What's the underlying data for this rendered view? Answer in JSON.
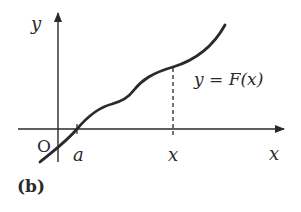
{
  "figure": {
    "panel_label": "(b)",
    "axes": {
      "y_label": "y",
      "x_label": "x",
      "origin_label": "O"
    },
    "ticks": {
      "a_label": "a",
      "x_label": "x"
    },
    "curve_label": "y = F(x)",
    "colors": {
      "stroke": "#2a2a2a",
      "background": "#ffffff"
    }
  }
}
